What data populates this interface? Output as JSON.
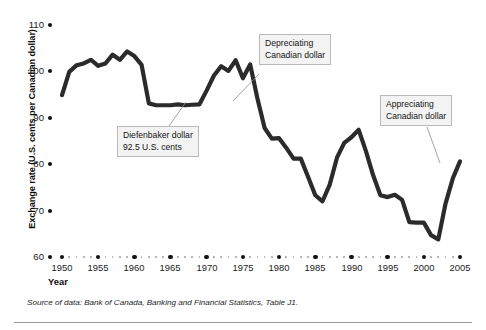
{
  "figure": {
    "axis": {
      "ylabel": "Exchange rate (U.S. cents per Canadian dollar)",
      "xlabel": "Year",
      "yticks": [
        "110",
        "100",
        "90",
        "80",
        "70",
        "60"
      ],
      "xticks": [
        "1950",
        "1955",
        "1960",
        "1965",
        "1970",
        "1975",
        "1980",
        "1985",
        "1990",
        "1995",
        "2000",
        "2005"
      ]
    },
    "source": "Source of data: Bank of Canada, Banking and Financial Statistics, Table J1.",
    "callouts": [
      {
        "name": "diefenbaker",
        "line1": "Diefenbaker dollar",
        "line2": "92.5 U.S. cents"
      },
      {
        "name": "depreciating",
        "line1": "Depreciating",
        "line2": "Canadian dollar"
      },
      {
        "name": "appreciating",
        "line1": "Appreciating",
        "line2": "Canadian dollar"
      }
    ],
    "colors": {
      "line": "#2b2b2b",
      "tick": "#111111",
      "minor_tick": "#aaaaaa",
      "callout_bg": "#f3f3f3",
      "callout_border": "#b9b9b9",
      "rule": "#9a9a9a"
    }
  },
  "chart_data": {
    "type": "line",
    "title": "",
    "xlabel": "Year",
    "ylabel": "Exchange rate (U.S. cents per Canadian dollar)",
    "xlim": [
      1950,
      2005
    ],
    "ylim": [
      60,
      110
    ],
    "grid": false,
    "legend": "none",
    "annotations": [
      {
        "text": "Diefenbaker dollar 92.5 U.S. cents",
        "points_to_year": 1964,
        "points_to_value": 92.5
      },
      {
        "text": "Depreciating Canadian dollar",
        "points_to_year": 1978,
        "points_to_value": 96
      },
      {
        "text": "Appreciating Canadian dollar",
        "points_to_year": 2003,
        "points_to_value": 68
      }
    ],
    "x": [
      1950,
      1951,
      1952,
      1953,
      1954,
      1955,
      1956,
      1957,
      1958,
      1959,
      1960,
      1961,
      1962,
      1963,
      1964,
      1965,
      1966,
      1967,
      1968,
      1969,
      1970,
      1971,
      1972,
      1973,
      1974,
      1975,
      1976,
      1977,
      1978,
      1979,
      1980,
      1981,
      1982,
      1983,
      1984,
      1985,
      1986,
      1987,
      1988,
      1989,
      1990,
      1991,
      1992,
      1993,
      1994,
      1995,
      1996,
      1997,
      1998,
      1999,
      2000,
      2001,
      2002,
      2003,
      2004,
      2005
    ],
    "values": [
      94.8,
      99.8,
      101.2,
      101.6,
      102.4,
      101.1,
      101.6,
      103.5,
      102.4,
      104.2,
      103.2,
      101.3,
      93.0,
      92.6,
      92.6,
      92.6,
      92.8,
      92.6,
      92.7,
      92.8,
      95.8,
      99.0,
      101.0,
      100.0,
      102.3,
      98.4,
      101.4,
      94.1,
      87.7,
      85.4,
      85.5,
      83.4,
      81.1,
      81.1,
      77.2,
      73.2,
      71.9,
      75.5,
      81.3,
      84.5,
      85.7,
      87.3,
      82.7,
      77.5,
      73.2,
      72.8,
      73.3,
      72.2,
      67.4,
      67.3,
      67.3,
      64.6,
      63.7,
      71.4,
      76.8,
      80.5
    ]
  }
}
